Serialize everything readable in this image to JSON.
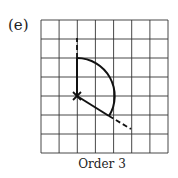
{
  "figure": {
    "label": "(e)",
    "caption": "Order 3",
    "grid": {
      "columns": 7,
      "rows": 7,
      "left": 41,
      "top": 20,
      "right": 168,
      "bottom": 153,
      "line_color": "#333333"
    },
    "center": {
      "x": 77,
      "y": 96,
      "marker": "x-mark"
    },
    "arc": {
      "start": [
        77,
        58
      ],
      "end": [
        109,
        116
      ],
      "radius": 38
    },
    "solid_segments": [
      [
        [
          77,
          96
        ],
        [
          77,
          58
        ]
      ],
      [
        [
          77,
          96
        ],
        [
          109,
          116
        ]
      ]
    ],
    "dashed_segments": [
      [
        [
          77,
          58
        ],
        [
          77,
          38
        ]
      ],
      [
        [
          109,
          116
        ],
        [
          131,
          129
        ]
      ]
    ],
    "stroke_color": "#111111"
  }
}
